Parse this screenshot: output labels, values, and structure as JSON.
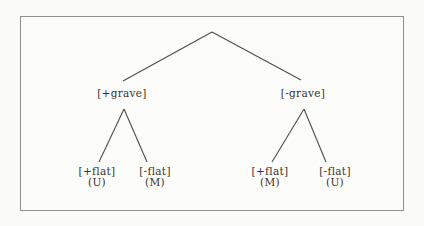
{
  "figure": {
    "type": "tree-diagram",
    "colors": {
      "line": "#4d4d4d",
      "text": "#38332e",
      "frame_border": "#8f8f8f",
      "panel_background": "#fcfcfa",
      "page_background": "#fafaf7"
    },
    "tree": {
      "level1": [
        {
          "label": "[+grave]"
        },
        {
          "label": "[-grave]"
        }
      ],
      "leaves": [
        {
          "label": "[+flat]",
          "value": "(U)"
        },
        {
          "label": "[-flat]",
          "value": "(M)"
        },
        {
          "label": "[+flat]",
          "value": "(M)"
        },
        {
          "label": "[-flat]",
          "value": "(U)"
        }
      ]
    }
  }
}
